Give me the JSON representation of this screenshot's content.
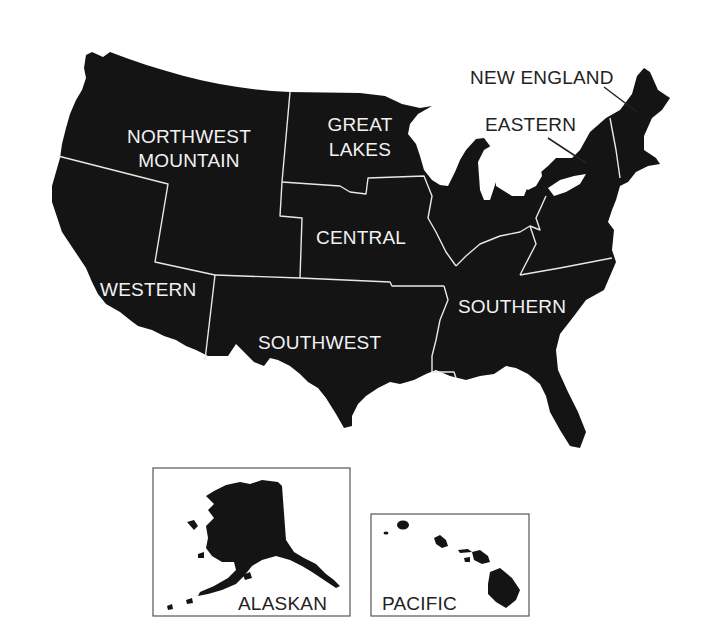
{
  "map": {
    "title": "FAA Regions",
    "colors": {
      "land": "#141414",
      "border": "#e8e8e8",
      "label_on_land": "#f2f2f2",
      "label_on_white": "#222222",
      "background": "#ffffff"
    },
    "regions": [
      {
        "id": "northwest-mountain",
        "line1": "NORTHWEST",
        "line2": "MOUNTAIN"
      },
      {
        "id": "great-lakes",
        "line1": "GREAT",
        "line2": "LAKES"
      },
      {
        "id": "new-england",
        "line1": "NEW ENGLAND"
      },
      {
        "id": "eastern",
        "line1": "EASTERN"
      },
      {
        "id": "central",
        "line1": "CENTRAL"
      },
      {
        "id": "western",
        "line1": "WESTERN"
      },
      {
        "id": "southwest",
        "line1": "SOUTHWEST"
      },
      {
        "id": "southern",
        "line1": "SOUTHERN"
      }
    ],
    "insets": [
      {
        "id": "alaskan",
        "label": "ALASKAN"
      },
      {
        "id": "pacific",
        "label": "PACIFIC"
      }
    ]
  }
}
